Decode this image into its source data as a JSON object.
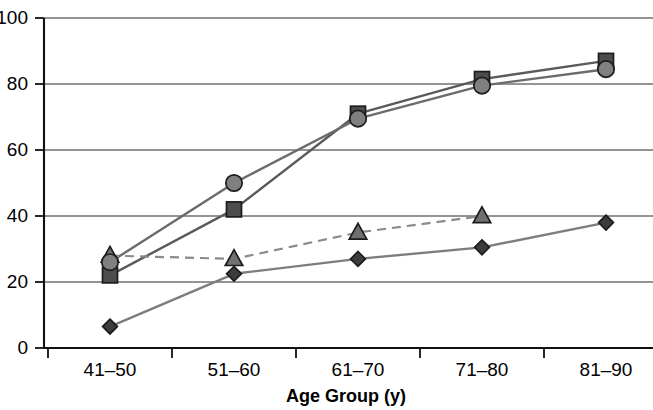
{
  "chart_data": {
    "type": "line",
    "title": "",
    "xlabel": "Age Group (y)",
    "ylabel": "",
    "categories": [
      "41–50",
      "51–60",
      "61–70",
      "71–80",
      "81–90"
    ],
    "ylim": [
      0,
      100
    ],
    "yticks": [
      0,
      20,
      40,
      60,
      80,
      100
    ],
    "ytick_labels": [
      "0",
      "20",
      "40",
      "60",
      "80",
      "100"
    ],
    "grid": true,
    "legend": "none",
    "series": [
      {
        "name": "square-series",
        "marker": "square",
        "line_style": "solid",
        "color": "#5a5a5a",
        "marker_fill": "#4d4d4d",
        "values": [
          22,
          42,
          71,
          81.5,
          87
        ]
      },
      {
        "name": "circle-series",
        "marker": "circle",
        "line_style": "solid",
        "color": "#6b6b6b",
        "marker_fill": "#808080",
        "values": [
          26,
          50,
          69.5,
          79.5,
          84.5
        ]
      },
      {
        "name": "triangle-series",
        "marker": "triangle",
        "line_style": "dashed",
        "color": "#8a8a8a",
        "marker_fill": "#707070",
        "values": [
          28,
          27,
          35,
          40,
          null
        ]
      },
      {
        "name": "diamond-series",
        "marker": "diamond",
        "line_style": "solid",
        "color": "#7d7d7d",
        "marker_fill": "#3c3c3c",
        "values": [
          6.5,
          22.5,
          27,
          30.5,
          38
        ]
      }
    ]
  },
  "axes": {
    "x_title": "Age Group (y)",
    "y_tick_0": "0",
    "y_tick_20": "20",
    "y_tick_40": "40",
    "y_tick_60": "60",
    "y_tick_80": "80",
    "y_tick_100": "100",
    "x_cat_0": "41–50",
    "x_cat_1": "51–60",
    "x_cat_2": "61–70",
    "x_cat_3": "71–80",
    "x_cat_4": "81–90"
  }
}
